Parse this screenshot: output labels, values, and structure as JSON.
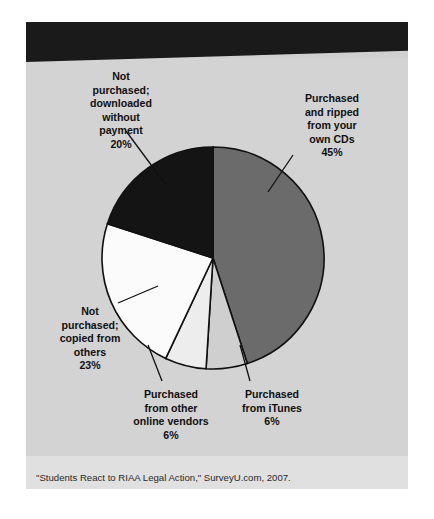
{
  "figure": {
    "title": "HOW DO COLLEGE STUDENTS OBTAIN MUSIC?",
    "source": "\"Students React to RIAA Legal Action,\" SurveyU.com, 2007."
  },
  "labels": {
    "ripped": "Purchased\nand ripped\nfrom your\nown CDs\n45%",
    "downloaded": "Not\npurchased;\ndownloaded\nwithout\npayment\n20%",
    "copied": "Not\npurchased;\ncopied from\nothers\n23%",
    "vendors": "Purchased\nfrom other\nonline vendors\n6%",
    "itunes": "Purchased\nfrom iTunes\n6%"
  },
  "colors": {
    "panel_background": "#d3d3d3",
    "banner_background": "#1a1a1a",
    "banner_text": "#ffffff",
    "source_strip": "#e0e0e0",
    "slice_outline": "#101010"
  },
  "chart_data": {
    "type": "pie",
    "title": "HOW DO COLLEGE STUDENTS OBTAIN MUSIC?",
    "xlabel": "",
    "ylabel": "",
    "legend_position": "none",
    "grid": false,
    "start_angle_deg": 0,
    "direction": "clockwise",
    "units": "percent",
    "categories": [
      "Purchased and ripped from your own CDs",
      "Purchased from iTunes",
      "Purchased from other online vendors",
      "Not purchased; copied from others",
      "Not purchased; downloaded without payment"
    ],
    "values": [
      45,
      6,
      6,
      23,
      20
    ],
    "slice_colors": [
      "#6b6b6b",
      "#cfcfcf",
      "#ededed",
      "#fbfbfb",
      "#141414"
    ],
    "annotations": [
      "Purchased and ripped from your own CDs 45%",
      "Purchased from iTunes 6%",
      "Purchased from other online vendors 6%",
      "Not purchased; copied from others 23%",
      "Not purchased; downloaded without payment 20%"
    ],
    "source": "\"Students React to RIAA Legal Action,\" SurveyU.com, 2007."
  }
}
